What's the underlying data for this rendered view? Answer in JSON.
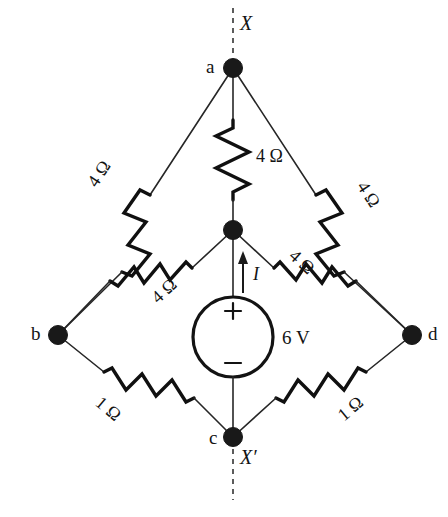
{
  "diagram": {
    "stroke_color": "#131313",
    "background": "#ffffff",
    "nodes": [
      {
        "id": "a",
        "label": "a",
        "x": 233,
        "y": 68
      },
      {
        "id": "b",
        "label": "b",
        "x": 58,
        "y": 335
      },
      {
        "id": "c",
        "label": "c",
        "x": 233,
        "y": 437
      },
      {
        "id": "d",
        "label": "d",
        "x": 412,
        "y": 335
      },
      {
        "id": "m",
        "label": "",
        "x": 233,
        "y": 230
      }
    ],
    "resistors": [
      {
        "id": "r-a-m",
        "label": "4 Ω",
        "value": 4,
        "unit": "Ω",
        "from": "a",
        "to": "m",
        "orientation": "vertical"
      },
      {
        "id": "r-a-b",
        "label": "4 Ω",
        "value": 4,
        "unit": "Ω",
        "from": "a",
        "to": "b",
        "orientation": "diagonal-left"
      },
      {
        "id": "r-a-d",
        "label": "4 Ω",
        "value": 4,
        "unit": "Ω",
        "from": "a",
        "to": "d",
        "orientation": "diagonal-right"
      },
      {
        "id": "r-m-b",
        "label": "4 Ω",
        "value": 4,
        "unit": "Ω",
        "from": "m",
        "to": "b",
        "orientation": "diagonal-left"
      },
      {
        "id": "r-m-d",
        "label": "4 Ω",
        "value": 4,
        "unit": "Ω",
        "from": "m",
        "to": "d",
        "orientation": "diagonal-right"
      },
      {
        "id": "r-b-c",
        "label": "1 Ω",
        "value": 1,
        "unit": "Ω",
        "from": "b",
        "to": "c",
        "orientation": "diagonal-right-down"
      },
      {
        "id": "r-d-c",
        "label": "1 Ω",
        "value": 1,
        "unit": "Ω",
        "from": "d",
        "to": "c",
        "orientation": "diagonal-left-down"
      }
    ],
    "source": {
      "id": "vsource",
      "label": "6 V",
      "value": 6,
      "unit": "V",
      "plus": "+",
      "minus": "−",
      "shape": "circle"
    },
    "current": {
      "label": "I",
      "direction": "up"
    },
    "cut_markers": [
      {
        "id": "cut-x",
        "label": "X",
        "position": "top"
      },
      {
        "id": "cut-xprime",
        "label": "X′",
        "position": "bottom"
      }
    ]
  }
}
